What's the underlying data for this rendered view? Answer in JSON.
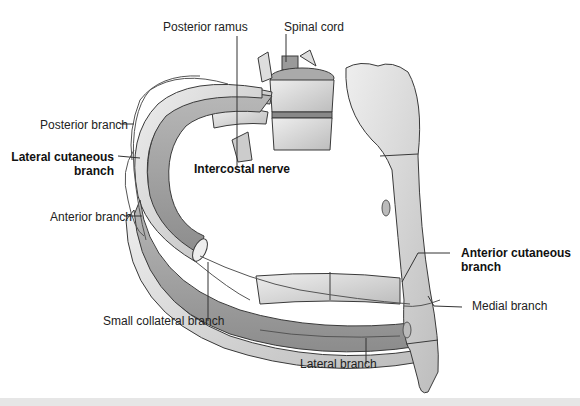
{
  "figure": {
    "labels": {
      "posterior_ramus": "Posterior ramus",
      "spinal_cord": "Spinal cord",
      "posterior_branch": "Posterior branch",
      "lateral_cutaneous_line1": "Lateral cutaneous",
      "lateral_cutaneous_line2": "branch",
      "intercostal_nerve": "Intercostal nerve",
      "anterior_branch": "Anterior branch",
      "anterior_cutaneous_line1": "Anterior cutaneous",
      "anterior_cutaneous_line2": "branch",
      "medial_branch": "Medial branch",
      "small_collateral_branch": "Small collateral branch",
      "lateral_branch": "Lateral branch"
    },
    "colors": {
      "background": "#ffffff",
      "bone": "#d9d9d9",
      "bone_dark": "#9a9a9a",
      "muscle": "#a8a8a8",
      "outline": "#3a3a3a",
      "leader_line": "#333333"
    }
  }
}
